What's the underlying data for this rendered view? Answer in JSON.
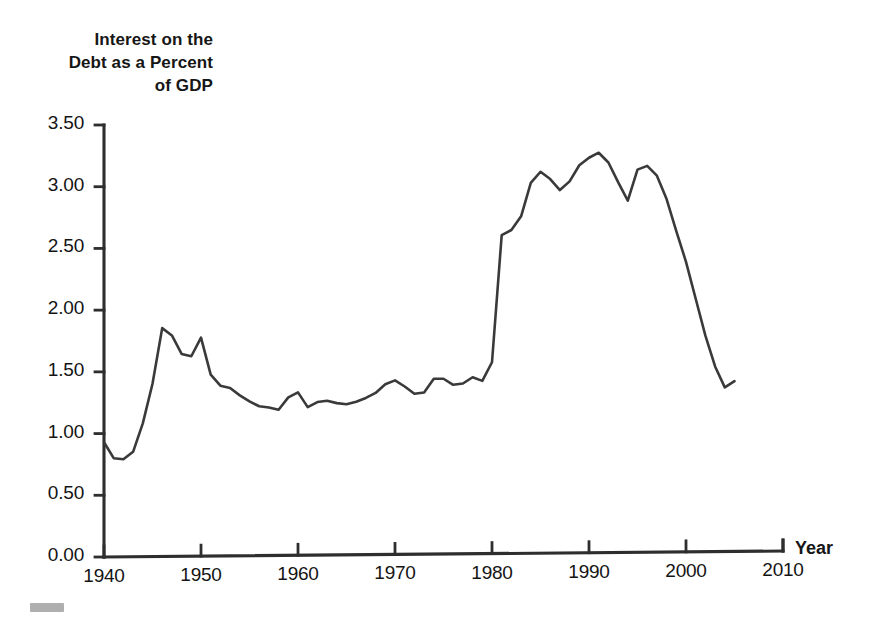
{
  "chart_data": {
    "type": "line",
    "title": "Interest on the\nDebt as a Percent\nof GDP",
    "title_lines": [
      "Interest on the",
      "Debt as a Percent",
      "of GDP"
    ],
    "xlabel": "Year",
    "ylabel": "Interest on the Debt as a Percent of GDP",
    "xlim": [
      1940,
      2010
    ],
    "ylim": [
      0.0,
      3.5
    ],
    "grid": false,
    "legend": "none",
    "line_color": "#3a3a3a",
    "y_ticks": [
      "0.00",
      "0.50",
      "1.00",
      "1.50",
      "2.00",
      "2.50",
      "3.00",
      "3.50"
    ],
    "y_tick_values": [
      0.0,
      0.5,
      1.0,
      1.5,
      2.0,
      2.5,
      3.0,
      3.5
    ],
    "x_ticks": [
      "1940",
      "1950",
      "1960",
      "1970",
      "1980",
      "1990",
      "2000",
      "2010"
    ],
    "x_tick_values": [
      1940,
      1950,
      1960,
      1970,
      1980,
      1990,
      2000,
      2010
    ],
    "x": [
      1940,
      1941,
      1942,
      1943,
      1944,
      1945,
      1946,
      1947,
      1948,
      1949,
      1950,
      1951,
      1952,
      1953,
      1954,
      1955,
      1956,
      1957,
      1958,
      1959,
      1960,
      1961,
      1962,
      1963,
      1964,
      1965,
      1966,
      1967,
      1968,
      1969,
      1970,
      1971,
      1972,
      1973,
      1974,
      1975,
      1976,
      1977,
      1978,
      1979,
      1980,
      1981,
      1982,
      1983,
      1984,
      1985,
      1986,
      1987,
      1988,
      1989,
      1990,
      1991,
      1992,
      1993,
      1994,
      1995,
      1996,
      1997,
      1998,
      1999,
      2000,
      2001,
      2002,
      2003,
      2004,
      2005
    ],
    "values": [
      0.93,
      0.8,
      0.79,
      0.85,
      1.08,
      1.4,
      1.85,
      1.79,
      1.64,
      1.62,
      1.77,
      1.47,
      1.38,
      1.36,
      1.3,
      1.25,
      1.21,
      1.2,
      1.18,
      1.28,
      1.32,
      1.2,
      1.24,
      1.25,
      1.23,
      1.22,
      1.24,
      1.27,
      1.31,
      1.38,
      1.41,
      1.36,
      1.3,
      1.31,
      1.42,
      1.42,
      1.37,
      1.38,
      1.43,
      1.4,
      1.55,
      2.58,
      2.62,
      2.73,
      3.0,
      3.09,
      3.03,
      2.94,
      3.01,
      3.14,
      3.2,
      3.24,
      3.16,
      3.0,
      2.85,
      3.1,
      3.13,
      3.05,
      2.86,
      2.6,
      2.35,
      2.05,
      1.75,
      1.5,
      1.33,
      1.38
    ],
    "series_name": "Interest on the Debt as a Percent of GDP",
    "annotations": [
      {
        "label": "wartime trough",
        "x": 1942,
        "y": 0.79
      },
      {
        "label": "postwar peak",
        "x": 1946,
        "y": 1.85
      },
      {
        "label": "maximum",
        "x": 1991,
        "y": 3.24
      },
      {
        "label": "secondary peak",
        "x": 1996,
        "y": 3.13
      },
      {
        "label": "end of series",
        "x": 2005,
        "y": 1.38
      }
    ]
  },
  "axes": {
    "x_title": "Year"
  }
}
